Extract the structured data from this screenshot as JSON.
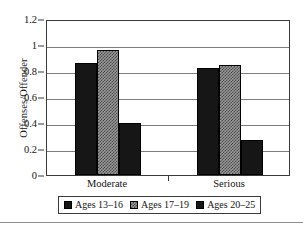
{
  "chart_data": {
    "type": "bar",
    "title": "",
    "xlabel": "",
    "ylabel": "Offenses/Offender",
    "categories": [
      "Moderate",
      "Serious"
    ],
    "series": [
      {
        "name": "Ages 13–16",
        "values": [
          0.86,
          0.82
        ],
        "color": "#161616",
        "fill": "solid"
      },
      {
        "name": "Ages 17–19",
        "values": [
          0.96,
          0.85
        ],
        "color": "#9a9a9a",
        "fill": "checker"
      },
      {
        "name": "Ages 20–25",
        "values": [
          0.4,
          0.27
        ],
        "color": "#161616",
        "fill": "solid"
      }
    ],
    "ylim": [
      0,
      1.2
    ],
    "yticks": [
      0,
      0.2,
      0.4,
      0.6,
      0.8,
      1,
      1.2
    ],
    "ytick_labels": [
      "0",
      "0.2",
      "0.4",
      "0.6",
      "0.8",
      "1",
      "1.2"
    ],
    "grid": "horizontal",
    "legend_position": "bottom"
  }
}
